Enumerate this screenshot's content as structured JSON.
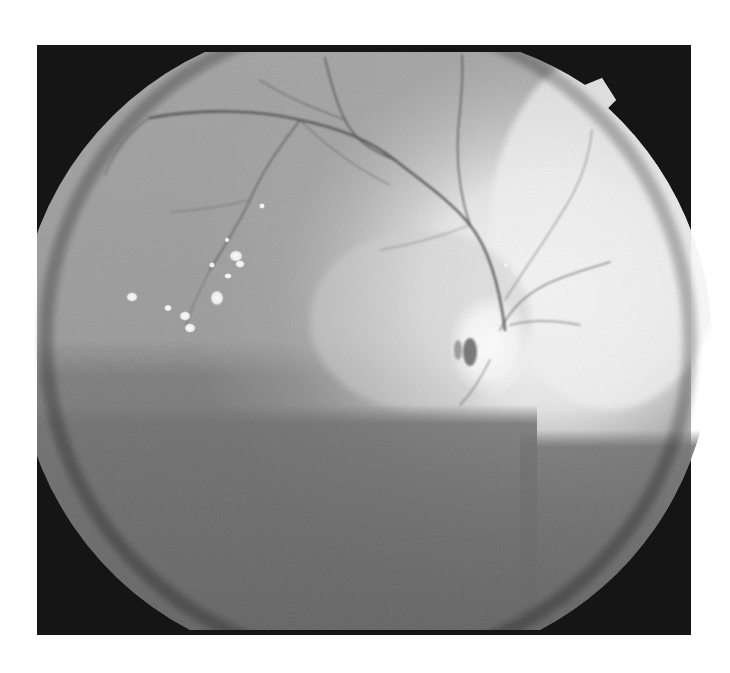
{
  "image": {
    "kind": "retinal fundus photograph (grayscale)",
    "width": 730,
    "height": 673,
    "background": "#ffffff",
    "frame": {
      "x": 37,
      "y": 45,
      "width": 654,
      "height": 590,
      "color": "#151515"
    },
    "field_of_view": {
      "center_x": 368,
      "center_y": 340,
      "radius": 322,
      "clip_top": 52,
      "clip_bottom": 630,
      "notch": "top-right orientation marker"
    },
    "features": {
      "optic_disc": {
        "x": 490,
        "y": 345,
        "description": "bright disc with vessels radiating"
      },
      "exudates": [
        {
          "x": 132,
          "y": 297,
          "r": 6
        },
        {
          "x": 168,
          "y": 308,
          "r": 4
        },
        {
          "x": 185,
          "y": 316,
          "r": 6
        },
        {
          "x": 190,
          "y": 328,
          "r": 6
        },
        {
          "x": 217,
          "y": 298,
          "r": 7
        },
        {
          "x": 236,
          "y": 256,
          "r": 6
        },
        {
          "x": 228,
          "y": 276,
          "r": 4
        },
        {
          "x": 212,
          "y": 265,
          "r": 3
        },
        {
          "x": 262,
          "y": 206,
          "r": 3
        },
        {
          "x": 227,
          "y": 240,
          "r": 3
        },
        {
          "x": 506,
          "y": 265,
          "r": 3
        }
      ],
      "colors": {
        "retina_mid": "#8a8a8a",
        "retina_light": "#b8b8b8",
        "retina_bright": "#f4f4f4",
        "retina_dark_lower": "#6e6e6e",
        "vessel": "#4a4a4a",
        "exudate": "#ffffff"
      }
    }
  }
}
